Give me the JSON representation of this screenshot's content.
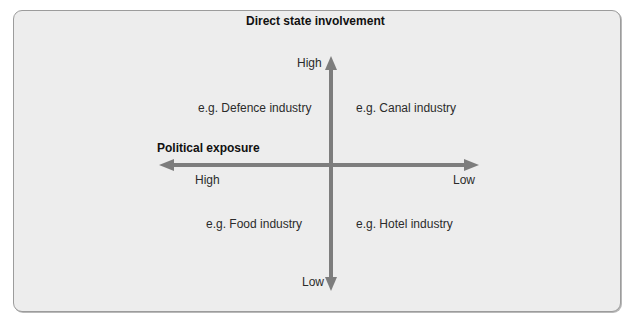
{
  "diagram": {
    "type": "quadrant-matrix",
    "colors": {
      "panel_background": "#ededed",
      "panel_border": "#9c9c9c",
      "axis": "#7d7d7d",
      "text": "#2b2b2b",
      "title_text": "#111111"
    },
    "vertical_axis": {
      "title": "Direct state involvement",
      "high_label": "High",
      "low_label": "Low"
    },
    "horizontal_axis": {
      "title": "Political exposure",
      "high_label": "High",
      "low_label": "Low"
    },
    "quadrants": {
      "top_left": "e.g. Defence industry",
      "top_right": "e.g. Canal industry",
      "bottom_left": "e.g. Food industry",
      "bottom_right": "e.g. Hotel industry"
    }
  }
}
